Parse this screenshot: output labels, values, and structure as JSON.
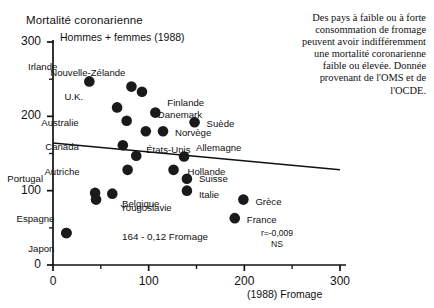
{
  "chart_data": {
    "type": "scatter",
    "title": "Mortalité coronarienne",
    "subtitle": "Hommes + femmes (1988)",
    "xlabel": "(1988) Fromage",
    "ylabel": "Mortalité coronarienne",
    "xlim": [
      0,
      300
    ],
    "ylim": [
      0,
      300
    ],
    "xticks": [
      0,
      100,
      200,
      300
    ],
    "yticks": [
      0,
      100,
      200,
      300
    ],
    "xtick_labels": [
      "0",
      "100",
      "200",
      "300"
    ],
    "ytick_labels": [
      "0",
      "100",
      "200",
      "300"
    ],
    "minor_ticks": true,
    "grid": false,
    "legend": "none",
    "marker_color": "#1a1a1a",
    "regression": {
      "equation": "164 - 0,12 Fromage",
      "r_text": "r=-0,009",
      "significance": "NS",
      "slope": -0.12,
      "intercept": 164,
      "x_start": 0,
      "x_end": 300,
      "y_start": 164,
      "y_end": 128
    },
    "points": [
      {
        "label": "Irlande",
        "x": 38,
        "y": 247,
        "label_dx": -32,
        "label_dy": -14
      },
      {
        "label": "Nouvelle-Zélande",
        "x": 82,
        "y": 240,
        "label_dx": -6,
        "label_dy": -14
      },
      {
        "label": "",
        "x": 93,
        "y": 233,
        "label_dx": 0,
        "label_dy": 0
      },
      {
        "label": "U.K.",
        "x": 67,
        "y": 212,
        "label_dx": -34,
        "label_dy": -10
      },
      {
        "label": "Finlande",
        "x": 107,
        "y": 205,
        "label_dx": 12,
        "label_dy": -10
      },
      {
        "label": "Danemark",
        "x": 97,
        "y": 180,
        "label_dx": 12,
        "label_dy": -16
      },
      {
        "label": "Suède",
        "x": 148,
        "y": 192,
        "label_dx": 12,
        "label_dy": 2
      },
      {
        "label": "Australie",
        "x": 77,
        "y": 194,
        "label_dx": -48,
        "label_dy": 2
      },
      {
        "label": "Norvège",
        "x": 115,
        "y": 180,
        "label_dx": 12,
        "label_dy": 2
      },
      {
        "label": "Canada",
        "x": 73,
        "y": 161,
        "label_dx": -44,
        "label_dy": 2
      },
      {
        "label": "États-Unis",
        "x": 87,
        "y": 147,
        "label_dx": 10,
        "label_dy": -6
      },
      {
        "label": "Allemagne",
        "x": 137,
        "y": 146,
        "label_dx": 12,
        "label_dy": -8
      },
      {
        "label": "Autriche",
        "x": 78,
        "y": 128,
        "label_dx": -48,
        "label_dy": 2
      },
      {
        "label": "Hollande",
        "x": 126,
        "y": 128,
        "label_dx": 14,
        "label_dy": 2
      },
      {
        "label": "Suisse",
        "x": 140,
        "y": 116,
        "label_dx": 12,
        "label_dy": 0
      },
      {
        "label": "Italie",
        "x": 140,
        "y": 100,
        "label_dx": 12,
        "label_dy": 4
      },
      {
        "label": "Portugal",
        "x": 44,
        "y": 97,
        "label_dx": -52,
        "label_dy": -14
      },
      {
        "label": "Belgique",
        "x": 45,
        "y": 88,
        "label_dx": 26,
        "label_dy": 4
      },
      {
        "label": "Yougoslavie",
        "x": 62,
        "y": 96,
        "label_dx": 8,
        "label_dy": 14
      },
      {
        "label": "Grèce",
        "x": 199,
        "y": 88,
        "label_dx": 12,
        "label_dy": 2
      },
      {
        "label": "France",
        "x": 190,
        "y": 63,
        "label_dx": 12,
        "label_dy": 2
      },
      {
        "label": "Espagne",
        "x": 14,
        "y": 43,
        "label_dx": -12,
        "label_dy": -14
      },
      {
        "label": "Japon",
        "x": 14,
        "y": 43,
        "label_dx": -12,
        "label_dy": 16
      }
    ]
  },
  "caption": {
    "text": "Des pays à faible ou à forte consommation de fromage peuvent avoir indifféremment une mortalité coronarienne faible ou élevée. Donnée provenant de l'OMS et de l'OCDE."
  }
}
